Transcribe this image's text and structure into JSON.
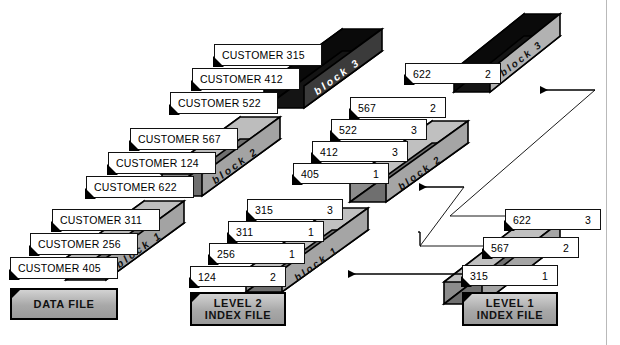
{
  "diagram": {
    "colors": {
      "ink": "#000000",
      "card_fill": "#ffffff",
      "slab_light": "#c9c9c9",
      "slab_mid": "#a6a6a6",
      "slab_dark": "#6e6e6e",
      "slab_black": "#0a0a0a",
      "page_rule": "#b9b9b9"
    },
    "files": [
      {
        "id": "data-file",
        "caption_line1": "DATA",
        "caption_line2": "FILE",
        "caption": "DATA  FILE",
        "blocks": [
          {
            "name": "block 1",
            "records": [
              {
                "label": "CUSTOMER 405"
              },
              {
                "label": "CUSTOMER 256"
              },
              {
                "label": "CUSTOMER 311"
              }
            ]
          },
          {
            "name": "block 2",
            "records": [
              {
                "label": "CUSTOMER 622"
              },
              {
                "label": "CUSTOMER 124"
              },
              {
                "label": "CUSTOMER 567"
              }
            ]
          },
          {
            "name": "block 3",
            "records": [
              {
                "label": "CUSTOMER 522"
              },
              {
                "label": "CUSTOMER 412"
              },
              {
                "label": "CUSTOMER 315"
              }
            ]
          }
        ]
      },
      {
        "id": "level-2-index-file",
        "caption_line1": "LEVEL 2",
        "caption_line2": "INDEX FILE",
        "caption": "LEVEL 2 INDEX FILE",
        "blocks": [
          {
            "name": "block 1",
            "records": [
              {
                "key": "124",
                "pointer": "2"
              },
              {
                "key": "256",
                "pointer": "1"
              },
              {
                "key": "311",
                "pointer": "1"
              },
              {
                "key": "315",
                "pointer": "3"
              }
            ]
          },
          {
            "name": "block 2",
            "records": [
              {
                "key": "405",
                "pointer": "1"
              },
              {
                "key": "412",
                "pointer": "3"
              },
              {
                "key": "522",
                "pointer": "3"
              },
              {
                "key": "567",
                "pointer": "2"
              }
            ]
          },
          {
            "name": "block 3",
            "records": [
              {
                "key": "622",
                "pointer": "2"
              }
            ]
          }
        ]
      },
      {
        "id": "level-1-index-file",
        "caption_line1": "LEVEL 1",
        "caption_line2": "INDEX FILE",
        "caption": "LEVEL 1 INDEX FILE",
        "blocks": [
          {
            "name": "",
            "records": [
              {
                "key": "315",
                "pointer": "1"
              },
              {
                "key": "567",
                "pointer": "2"
              },
              {
                "key": "622",
                "pointer": "3"
              }
            ]
          }
        ]
      }
    ],
    "connections": [
      {
        "from": "level-1-record-315",
        "to": "level-2-block-1",
        "kind": "arrow-left"
      },
      {
        "from": "level-1-record-567",
        "to": "level-2-block-2",
        "kind": "arrow-left"
      },
      {
        "from": "level-1-record-622",
        "to": "level-2-block-3",
        "kind": "arrow-left"
      }
    ]
  }
}
